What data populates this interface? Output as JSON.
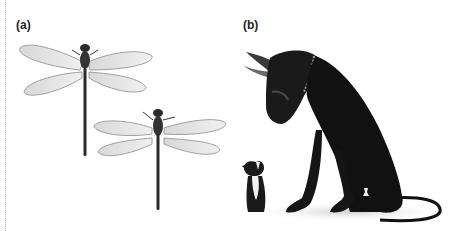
{
  "figure": {
    "panels": [
      {
        "id": "a",
        "label": "(a)",
        "subject": "two dragonflies of different sizes"
      },
      {
        "id": "b",
        "label": "(b)",
        "subject": "great dane looking down at a small chihuahua"
      }
    ]
  },
  "colors": {
    "background": "#ffffff",
    "wing": "#e6e6e6",
    "wing_edge": "#8a8a8a",
    "body": "#2a2a2a",
    "dog": "#111111",
    "chest": "#f2f2f2",
    "border": "#b8b8b8"
  }
}
